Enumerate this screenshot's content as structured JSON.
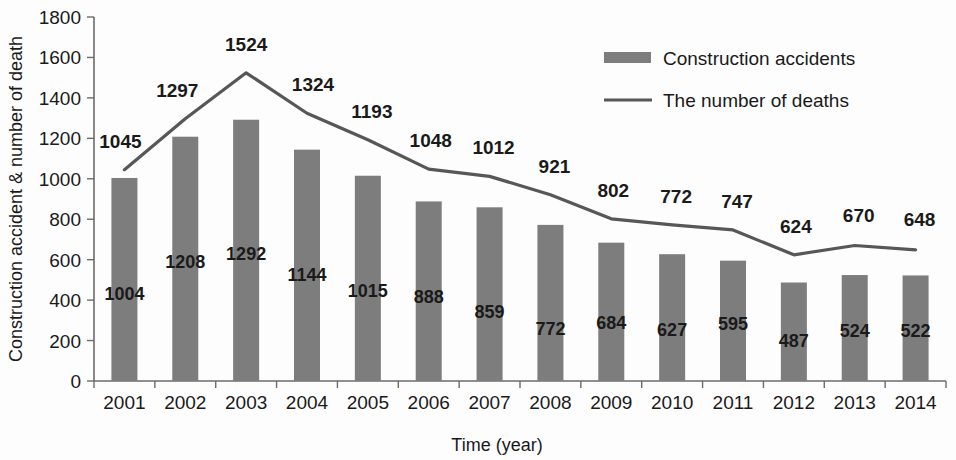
{
  "chart_data": {
    "type": "bar",
    "title": "",
    "subtitle": "",
    "xlabel": "Time (year)",
    "ylabel": "Construction accident & number of death",
    "categories": [
      "2001",
      "2002",
      "2003",
      "2004",
      "2005",
      "2006",
      "2007",
      "2008",
      "2009",
      "2010",
      "2011",
      "2012",
      "2013",
      "2014"
    ],
    "ylim": [
      0,
      1800
    ],
    "ytick_labels": [
      "0",
      "200",
      "400",
      "600",
      "800",
      "1000",
      "1200",
      "1400",
      "1600",
      "1800"
    ],
    "ytick_values": [
      0,
      200,
      400,
      600,
      800,
      1000,
      1200,
      1400,
      1600,
      1800
    ],
    "grid": false,
    "legend_position": "top-right",
    "series": [
      {
        "name": "Construction accidents",
        "type": "bar",
        "color": "#7d7d7d",
        "values": [
          1004,
          1208,
          1292,
          1144,
          1015,
          888,
          859,
          772,
          684,
          627,
          595,
          487,
          524,
          522
        ]
      },
      {
        "name": "The number of deaths",
        "type": "line",
        "color": "#575757",
        "values": [
          1045,
          1297,
          1524,
          1324,
          1193,
          1048,
          1012,
          921,
          802,
          772,
          747,
          624,
          670,
          648
        ]
      }
    ]
  },
  "legend": {
    "items": [
      {
        "label": "Construction accidents",
        "marker": "bar-swatch"
      },
      {
        "label": "The number of deaths",
        "marker": "line-swatch"
      }
    ]
  },
  "axes": {
    "y_title": "Construction accident & number of death",
    "x_title": "Time (year)"
  }
}
